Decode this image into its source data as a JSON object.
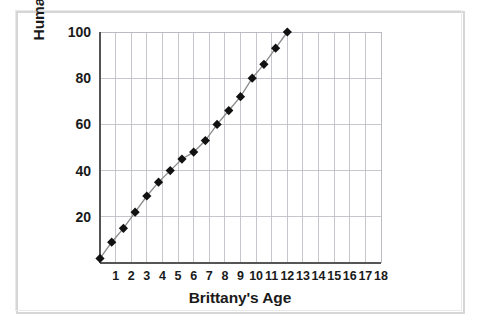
{
  "figure": {
    "background_color": "#ffffff",
    "frame_color": "#d6d6d6"
  },
  "chart_data": {
    "type": "line",
    "title": "",
    "xlabel": "Brittany's Age",
    "ylabel": "Human's Age",
    "xlim": [
      0,
      18
    ],
    "ylim": [
      0,
      100
    ],
    "xticks": [
      1,
      2,
      3,
      4,
      5,
      6,
      7,
      8,
      9,
      10,
      11,
      12,
      13,
      14,
      15,
      16,
      17,
      18
    ],
    "yticks": [
      20,
      40,
      60,
      80,
      100
    ],
    "xtick_labels": [
      "1",
      "2",
      "3",
      "4",
      "5",
      "6",
      "7",
      "8",
      "9",
      "10",
      "11",
      "12",
      "13",
      "14",
      "15",
      "16",
      "17",
      "18"
    ],
    "ytick_labels": [
      "20",
      "40",
      "60",
      "80",
      "100"
    ],
    "grid": true,
    "grid_color": "#b8b8c0",
    "legend": false,
    "marker": "diamond",
    "marker_color": "#111111",
    "line_color": "#8a8a8a",
    "x": [
      0,
      0.5,
      1,
      1.5,
      2,
      2.5,
      3,
      3.5,
      4,
      4.5,
      5,
      5.5,
      6,
      6.5,
      7,
      7.5,
      8,
      8.5,
      9,
      9.5,
      10,
      10.5,
      11,
      11.5,
      12,
      12.5,
      13,
      13.5,
      14
    ],
    "y": [
      2,
      8,
      14,
      21,
      28,
      34,
      38,
      42,
      46,
      49,
      52,
      56,
      60,
      64,
      68,
      72,
      76,
      80,
      84,
      87,
      90,
      93,
      96,
      98,
      100
    ],
    "points": [
      {
        "x": 0,
        "y": 2
      },
      {
        "x": 0.75,
        "y": 9
      },
      {
        "x": 1.5,
        "y": 15
      },
      {
        "x": 2.25,
        "y": 22
      },
      {
        "x": 3,
        "y": 29
      },
      {
        "x": 3.75,
        "y": 35
      },
      {
        "x": 4.5,
        "y": 40
      },
      {
        "x": 5.25,
        "y": 45
      },
      {
        "x": 6,
        "y": 48
      },
      {
        "x": 6.75,
        "y": 53
      },
      {
        "x": 7.5,
        "y": 60
      },
      {
        "x": 8.25,
        "y": 66
      },
      {
        "x": 9,
        "y": 72
      },
      {
        "x": 9.75,
        "y": 80
      },
      {
        "x": 10.5,
        "y": 86
      },
      {
        "x": 11.25,
        "y": 93
      },
      {
        "x": 12,
        "y": 100
      }
    ]
  }
}
